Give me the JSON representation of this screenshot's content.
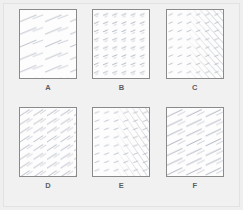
{
  "figure": {
    "type": "hatch-pattern-sample-grid",
    "background_color": "#efefef",
    "panel_background_color": "#fdfdfd",
    "panel_border_color": "#8a8a8a",
    "label_color": "#5d5d5d",
    "hatch_color": "#a9b0bb",
    "rows": 2,
    "columns": 3
  },
  "panels": [
    {
      "label": "A",
      "description": "sparse shallow diagonal dashes, uniform",
      "angle_degrees": 22,
      "density": "sparse",
      "dash_length": "long",
      "gradient": "none"
    },
    {
      "label": "B",
      "description": "regular lattice of very short shallow dashes",
      "angle_degrees": 20,
      "density": "regular-lattice",
      "dash_length": "very-short",
      "gradient": "none"
    },
    {
      "label": "C",
      "description": "short dots at left grading into dense long hatching at right",
      "angle_degrees": 42,
      "density": "graded",
      "dash_length": "mixed",
      "gradient": "left-to-right"
    },
    {
      "label": "D",
      "description": "medium density diagonal dashes covering full panel",
      "angle_degrees": 33,
      "density": "medium",
      "dash_length": "medium",
      "gradient": "none"
    },
    {
      "label": "E",
      "description": "short dashes at left grading into dense hatching at right",
      "angle_degrees": 35,
      "density": "graded",
      "dash_length": "mixed",
      "gradient": "left-to-right"
    },
    {
      "label": "F",
      "description": "long streaked diagonal lines, moderately dense",
      "angle_degrees": 35,
      "density": "medium-high",
      "dash_length": "long",
      "gradient": "none"
    }
  ]
}
